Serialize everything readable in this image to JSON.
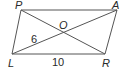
{
  "diagram": {
    "type": "parallelogram-with-diagonals",
    "vertices": [
      {
        "label": "P",
        "x": 21,
        "y": 10
      },
      {
        "label": "A",
        "x": 117,
        "y": 10
      },
      {
        "label": "R",
        "x": 105,
        "y": 54
      },
      {
        "label": "L",
        "x": 12,
        "y": 54
      }
    ],
    "intersection": {
      "label": "O",
      "x": 63,
      "y": 31
    },
    "measurements": {
      "LO": "6",
      "LR": "10"
    },
    "colors": {
      "stroke": "#555555",
      "text": "#2a2a2a",
      "background": "#ffffff"
    }
  }
}
